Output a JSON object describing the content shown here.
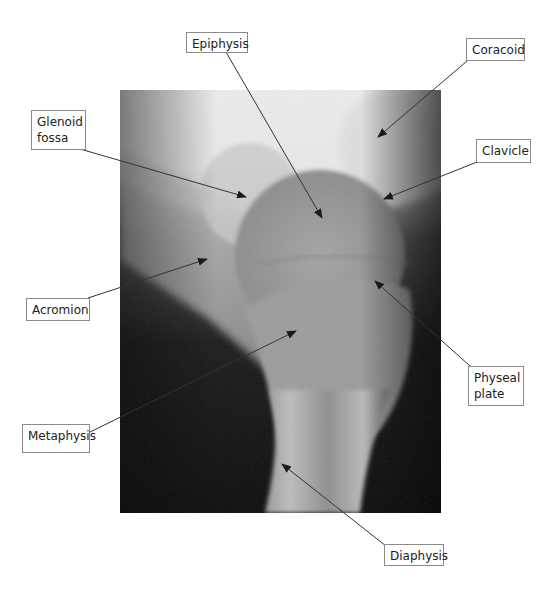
{
  "figure": {
    "type": "annotated-radiograph",
    "labels": [
      {
        "id": "epiphysis",
        "text": "Epiphysis",
        "box": [
          186,
          32,
          62,
          21
        ],
        "line": [
          [
            226,
            52
          ],
          [
            322,
            218
          ]
        ]
      },
      {
        "id": "coracoid",
        "text": "Coracoid",
        "box": [
          466,
          38,
          59,
          23
        ],
        "line": [
          [
            467,
            61
          ],
          [
            378,
            137
          ]
        ]
      },
      {
        "id": "glenoid-fossa",
        "text": "Glenoid\nfossa",
        "box": [
          31,
          110,
          55,
          40
        ],
        "line": [
          [
            80,
            149
          ],
          [
            246,
            197
          ]
        ]
      },
      {
        "id": "clavicle",
        "text": "Clavicle",
        "box": [
          476,
          139,
          55,
          24
        ],
        "line": [
          [
            477,
            162
          ],
          [
            384,
            199
          ]
        ]
      },
      {
        "id": "acromion",
        "text": "Acromion",
        "box": [
          26,
          298,
          64,
          23
        ],
        "line": [
          [
            88,
            298
          ],
          [
            207,
            259
          ]
        ]
      },
      {
        "id": "physeal-plate",
        "text": "Physeal\nplate",
        "box": [
          468,
          366,
          56,
          40
        ],
        "line": [
          [
            470,
            366
          ],
          [
            375,
            281
          ]
        ]
      },
      {
        "id": "metaphysis",
        "text": "Metaphysis",
        "box": [
          22,
          424,
          68,
          29
        ],
        "line": [
          [
            88,
            433
          ],
          [
            296,
            331
          ]
        ]
      },
      {
        "id": "diaphysis",
        "text": "Diaphysis",
        "box": [
          384,
          544,
          60,
          22
        ],
        "line": [
          [
            386,
            546
          ],
          [
            282,
            464
          ]
        ]
      }
    ],
    "colors": {
      "label_border": "#8a8a8a",
      "leader_line": "#333333",
      "background": "#ffffff"
    }
  }
}
